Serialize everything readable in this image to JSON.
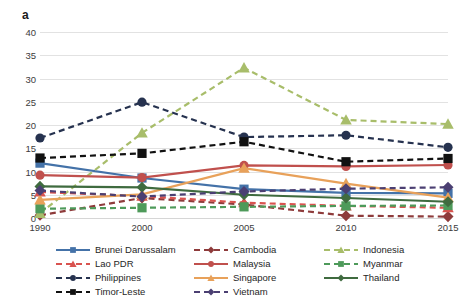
{
  "panel": {
    "label": "a"
  },
  "chart_data": {
    "type": "line",
    "title": "",
    "subtitle": "",
    "xlabel": "",
    "ylabel": "",
    "categories": [
      "1990",
      "2000",
      "2005",
      "2010",
      "2015"
    ],
    "x": [
      1990,
      2000,
      2005,
      2010,
      2015
    ],
    "ylim": [
      0,
      40
    ],
    "yticks": [
      0,
      5,
      10,
      15,
      20,
      25,
      30,
      35,
      40
    ],
    "ytick_labels": [
      "0",
      "5",
      "10",
      "15",
      "20",
      "25",
      "30",
      "35",
      "40"
    ],
    "grid": true,
    "legend_position": "bottom",
    "legend_columns": 3,
    "series": [
      {
        "name": "Brunei Darussalam",
        "color": "#4472a8",
        "dash": "solid",
        "marker": "square",
        "values": [
          11.8,
          8.6,
          6.2,
          5.4,
          5.3
        ]
      },
      {
        "name": "Cambodia",
        "color": "#8e3b3b",
        "dash": "dashed",
        "marker": "diamond",
        "values": [
          0.6,
          4.3,
          2.9,
          0.5,
          0.3
        ]
      },
      {
        "name": "Indonesia",
        "color": "#a8bd6a",
        "dash": "dashed",
        "marker": "triangle",
        "values": [
          1.0,
          18.3,
          32.3,
          21.1,
          20.2
        ]
      },
      {
        "name": "Lao PDR",
        "color": "#d9534f",
        "dash": "dashed",
        "marker": "triangle",
        "values": [
          5.6,
          4.7,
          3.3,
          2.6,
          2.2
        ]
      },
      {
        "name": "Malaysia",
        "color": "#c0504d",
        "dash": "solid",
        "marker": "circle",
        "values": [
          9.2,
          8.7,
          11.3,
          11.1,
          11.4
        ]
      },
      {
        "name": "Myanmar",
        "color": "#4e9a5a",
        "dash": "dashed",
        "marker": "square",
        "values": [
          2.0,
          2.2,
          2.4,
          2.6,
          2.7
        ]
      },
      {
        "name": "Philippines",
        "color": "#26324f",
        "dash": "dashed",
        "marker": "circle",
        "values": [
          17.2,
          24.9,
          17.4,
          17.8,
          15.2
        ]
      },
      {
        "name": "Singapore",
        "color": "#e8a15a",
        "dash": "solid",
        "marker": "triangle",
        "values": [
          3.9,
          5.1,
          10.7,
          7.4,
          4.4
        ]
      },
      {
        "name": "Thailand",
        "color": "#3f6b3f",
        "dash": "solid",
        "marker": "diamond",
        "values": [
          6.8,
          6.6,
          5.0,
          4.3,
          3.5
        ]
      },
      {
        "name": "Timor-Leste",
        "color": "#111111",
        "dash": "dashed",
        "marker": "square",
        "values": [
          12.9,
          13.9,
          16.4,
          12.1,
          12.8
        ]
      },
      {
        "name": "Vietnam",
        "color": "#4b3f72",
        "dash": "dashed",
        "marker": "diamond",
        "values": [
          5.9,
          4.6,
          5.7,
          6.3,
          6.6
        ]
      }
    ]
  }
}
